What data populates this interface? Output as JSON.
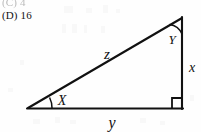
{
  "document": {
    "type": "scanned-math-worksheet-fragment",
    "background_color": "#fefefe",
    "ink_color": "#111111"
  },
  "choices": {
    "items": [
      {
        "label": "(C)",
        "value": "4",
        "clipped": true
      },
      {
        "label": "(D)",
        "value": "16",
        "clipped": false
      }
    ]
  },
  "figure": {
    "name": "right-triangle-diagram",
    "shape": "right triangle",
    "stroke_color": "#111111",
    "vertices": {
      "left": {
        "x": 28,
        "y": 108
      },
      "top_right": {
        "x": 182,
        "y": 18
      },
      "bottom_right": {
        "x": 182,
        "y": 108
      }
    },
    "side_labels": {
      "hypotenuse": "z",
      "vertical": "x",
      "horizontal": "y"
    },
    "angle_labels": {
      "left_vertex": "X",
      "top_vertex": "Y",
      "bottom_right_vertex": "right angle"
    },
    "markers": {
      "right_angle": "square",
      "left_angle": "arc",
      "top_angle": "arc"
    }
  }
}
